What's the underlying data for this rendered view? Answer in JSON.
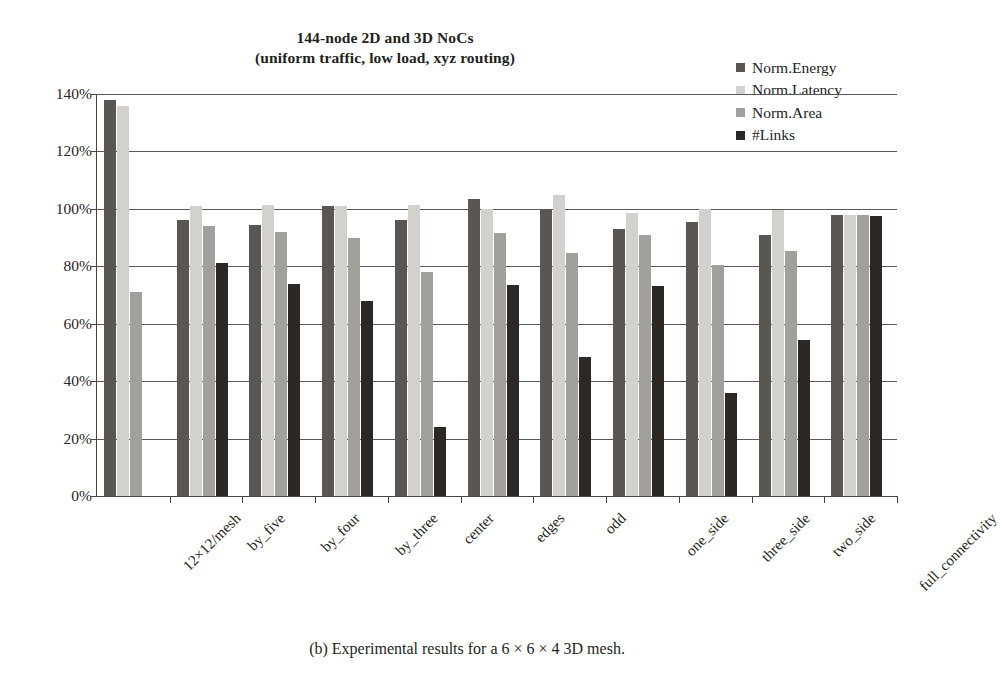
{
  "figure": {
    "title_line1": "144-node 2D and 3D NoCs",
    "title_line2": "(uniform traffic, low load, xyz routing)",
    "caption": "(b) Experimental results for a 6 × 6 × 4 3D mesh."
  },
  "colors": {
    "norm_energy": "#595654",
    "norm_latency": "#d2d1cd",
    "norm_area": "#a2a09c",
    "num_links": "#2b2826",
    "axis": "#4a4646",
    "grid": "#58595b",
    "text": "#231f20",
    "background": "#ffffff"
  },
  "legend": {
    "position": "top-right",
    "items": [
      {
        "label": "Norm.Energy",
        "color": "#595654",
        "swatch": "square-swatch"
      },
      {
        "label": "Norm.Latency",
        "color": "#d2d1cd",
        "swatch": "square-swatch"
      },
      {
        "label": "Norm.Area",
        "color": "#a2a09c",
        "swatch": "square-swatch"
      },
      {
        "label": "#Links",
        "color": "#2b2826",
        "swatch": "square-swatch"
      }
    ]
  },
  "chart_data": {
    "type": "bar",
    "title": "144-node 2D and 3D NoCs (uniform traffic, low load, xyz routing)",
    "xlabel": "",
    "ylabel": "",
    "ylim": [
      0,
      140
    ],
    "ytick_labels": [
      "0%",
      "20%",
      "40%",
      "60%",
      "80%",
      "100%",
      "120%",
      "140%"
    ],
    "ytick_values": [
      0,
      20,
      40,
      60,
      80,
      100,
      120,
      140
    ],
    "grid": true,
    "grid_axis": "y",
    "legend_position": "top-right",
    "units": "percent",
    "categories": [
      "12×12/mesh",
      "by_five",
      "by_four",
      "by_three",
      "center",
      "edges",
      "odd",
      "one_side",
      "three_side",
      "two_side",
      "full_connectivity"
    ],
    "series": [
      {
        "name": "Norm.Energy",
        "color": "#595654",
        "values": [
          138,
          96,
          94.5,
          101,
          96,
          103.5,
          100,
          93,
          95.5,
          91,
          98
        ]
      },
      {
        "name": "Norm.Latency",
        "color": "#d2d1cd",
        "values": [
          136,
          101,
          101.5,
          101,
          101.5,
          100,
          105,
          98.5,
          100,
          99.5,
          98
        ]
      },
      {
        "name": "Norm.Area",
        "color": "#a2a09c",
        "values": [
          71,
          94,
          92,
          90,
          78,
          91.5,
          84.5,
          91,
          80.5,
          85.5,
          98
        ]
      },
      {
        "name": "#Links",
        "color": "#2b2826",
        "values": [
          null,
          81,
          74,
          68,
          24,
          73.5,
          48.5,
          73,
          36,
          54.5,
          97.5
        ]
      }
    ]
  }
}
